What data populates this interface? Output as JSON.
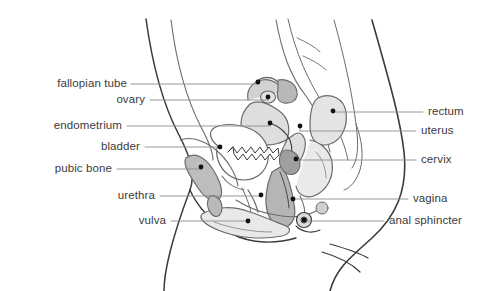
{
  "diagram": {
    "background": "#ffffff",
    "outline_color": "#3a3a3a",
    "organ_line_color": "#6b6b6b",
    "leader_color": "#8d8d8d",
    "text_color": "#3b3b3b",
    "fills": {
      "light_gray": "#e8e8e8",
      "mid_gray": "#d2d2d2",
      "dark_gray": "#b3b3b3",
      "white": "#ffffff"
    }
  },
  "labels_left": [
    {
      "id": "fallopian-tube",
      "text": "fallopian tube",
      "text_x": 127,
      "text_y": 84,
      "line_x1": 131,
      "line_x2": 258,
      "dot_x": 258,
      "dot_y": 82
    },
    {
      "id": "ovary",
      "text": "ovary",
      "text_x": 145,
      "text_y": 100,
      "line_x1": 150,
      "line_x2": 268,
      "dot_x": 268,
      "dot_y": 97
    },
    {
      "id": "endometrium",
      "text": "endometrium",
      "text_x": 122,
      "text_y": 126,
      "line_x1": 127,
      "line_x2": 270,
      "dot_x": 270,
      "dot_y": 123
    },
    {
      "id": "bladder",
      "text": "bladder",
      "text_x": 140,
      "text_y": 147,
      "line_x1": 145,
      "line_x2": 220,
      "dot_x": 220,
      "dot_y": 147
    },
    {
      "id": "pubic-bone",
      "text": "pubic bone",
      "text_x": 112,
      "text_y": 169,
      "line_x1": 117,
      "line_x2": 201,
      "dot_x": 201,
      "dot_y": 167
    },
    {
      "id": "urethra",
      "text": "urethra",
      "text_x": 155,
      "text_y": 196,
      "line_x1": 160,
      "line_x2": 261,
      "dot_x": 261,
      "dot_y": 195
    },
    {
      "id": "vulva",
      "text": "vulva",
      "text_x": 166,
      "text_y": 221,
      "line_x1": 171,
      "line_x2": 248,
      "dot_x": 248,
      "dot_y": 221
    }
  ],
  "labels_right": [
    {
      "id": "rectum",
      "text": "rectum",
      "text_x": 428,
      "text_y": 112,
      "line_x1": 333,
      "line_x2": 423,
      "dot_x": 333,
      "dot_y": 111
    },
    {
      "id": "uterus",
      "text": "uterus",
      "text_x": 421,
      "text_y": 131,
      "line_x1": 300,
      "line_x2": 416,
      "dot_x": 300,
      "dot_y": 126
    },
    {
      "id": "cervix",
      "text": "cervix",
      "text_x": 421,
      "text_y": 160,
      "line_x1": 296,
      "line_x2": 416,
      "dot_x": 296,
      "dot_y": 159
    },
    {
      "id": "vagina",
      "text": "vagina",
      "text_x": 413,
      "text_y": 199,
      "line_x1": 293,
      "line_x2": 408,
      "dot_x": 293,
      "dot_y": 199
    },
    {
      "id": "anal-sphincter",
      "text": "anal sphincter",
      "text_x": 389,
      "text_y": 221,
      "line_x1": 304,
      "line_x2": 384,
      "dot_x": 304,
      "dot_y": 220
    }
  ]
}
